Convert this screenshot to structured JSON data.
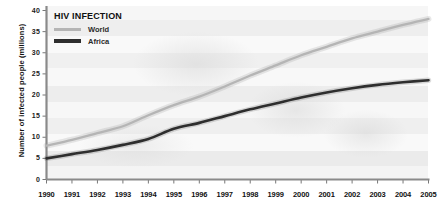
{
  "chart_data": {
    "type": "line",
    "title": "HIV INFECTION",
    "xlabel": "",
    "ylabel": "Number of infected people (millions)",
    "x": [
      1990,
      1991,
      1992,
      1993,
      1994,
      1995,
      1996,
      1997,
      1998,
      1999,
      2000,
      2001,
      2002,
      2003,
      2004,
      2005
    ],
    "xtick_labels": [
      "1990",
      "1991",
      "1992",
      "1993",
      "1994",
      "1995",
      "1996",
      "1997",
      "1998",
      "1999",
      "2000",
      "2001",
      "2002",
      "2003",
      "2004",
      "2005"
    ],
    "ytick_labels": [
      "0",
      "5",
      "10",
      "15",
      "20",
      "25",
      "30",
      "35",
      "40"
    ],
    "ytick_values": [
      0,
      5,
      10,
      15,
      20,
      25,
      30,
      35,
      40
    ],
    "ylim": [
      0,
      40
    ],
    "xlim": [
      1990,
      2005
    ],
    "grid": false,
    "legend_position": "top-left",
    "series": [
      {
        "name": "World",
        "color": "#b5b5b5",
        "values": [
          8.0,
          9.4,
          11.0,
          12.6,
          15.2,
          17.6,
          19.6,
          22.0,
          24.6,
          27.0,
          29.4,
          31.4,
          33.4,
          35.0,
          36.6,
          38.0
        ]
      },
      {
        "name": "Africa",
        "color": "#2e2e2e",
        "values": [
          5.0,
          6.0,
          7.0,
          8.2,
          9.6,
          12.0,
          13.4,
          15.0,
          16.6,
          18.0,
          19.4,
          20.6,
          21.6,
          22.4,
          23.0,
          23.5
        ]
      }
    ]
  },
  "legend": {
    "title": "HIV INFECTION",
    "entries": [
      {
        "label": "World"
      },
      {
        "label": "Africa"
      }
    ]
  },
  "axis": {
    "y_title": "Number of infected people (millions)"
  }
}
